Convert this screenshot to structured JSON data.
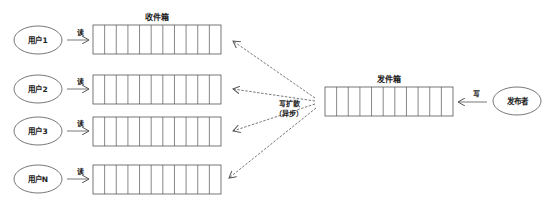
{
  "inbox": {
    "title": "收件箱",
    "cells": 11,
    "rows": [
      {
        "user": "用户1",
        "action": "读"
      },
      {
        "user": "用户2",
        "action": "读"
      },
      {
        "user": "用户3",
        "action": "读"
      },
      {
        "user": "用户N",
        "action": "读"
      }
    ]
  },
  "outbox": {
    "title": "发件箱",
    "cells": 11
  },
  "fanout": {
    "line1": "写扩散",
    "line2": "（异步）"
  },
  "publisher": {
    "label": "发布者",
    "action": "写"
  },
  "colors": {
    "stroke": "#555555",
    "text": "#222222",
    "background": "#ffffff"
  }
}
